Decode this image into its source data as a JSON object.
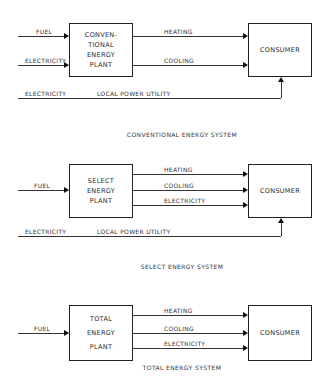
{
  "diagrams": [
    {
      "title": "CONVENTIONAL ENERGY SYSTEM",
      "plant_lines": [
        "CONVEN-",
        "TIONAL",
        "ENERGY",
        "PLANT"
      ],
      "consumer": "CONSUMER",
      "inputs": [
        "FUEL",
        "ELECTRICITY"
      ],
      "outputs": [
        "HEATING",
        "COOLING"
      ],
      "utility": {
        "source": "ELECTRICITY",
        "label": "LOCAL POWER UTILITY"
      }
    },
    {
      "title": "SELECT ENERGY SYSTEM",
      "plant_lines": [
        "SELECT",
        "ENERGY",
        "PLANT"
      ],
      "consumer": "CONSUMER",
      "inputs": [
        "FUEL"
      ],
      "outputs": [
        "HEATING",
        "COOLING",
        "ELECTRICITY"
      ],
      "utility": {
        "source": "ELECTRICITY",
        "label": "LOCAL POWER UTILITY"
      }
    },
    {
      "title": "TOTAL ENERGY SYSTEM",
      "plant_lines": [
        "TOTAL",
        "ENERGY",
        "PLANT"
      ],
      "consumer": "CONSUMER",
      "inputs": [
        "FUEL"
      ],
      "outputs": [
        "HEATING",
        "COOLING",
        "ELECTRICITY"
      ]
    }
  ]
}
